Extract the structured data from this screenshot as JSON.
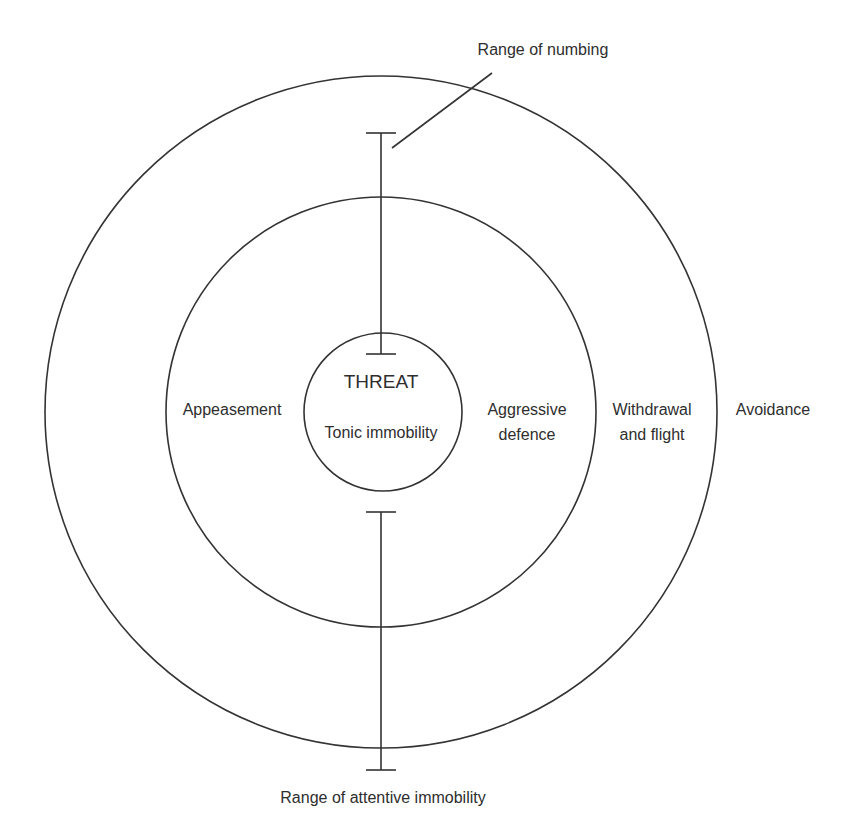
{
  "diagram": {
    "type": "concentric-circles",
    "colors": {
      "line": "#333333",
      "text": "#2e2e2e",
      "background": "#ffffff"
    },
    "center": {
      "title": "THREAT",
      "label": "Tonic immobility"
    },
    "rings": [
      {
        "name": "inner",
        "left_label": "",
        "right_label_lines": [
          "Aggressive",
          "defence"
        ]
      },
      {
        "name": "middle",
        "left_label": "Appeasement",
        "right_label_lines": [
          "Withdrawal",
          "and flight"
        ]
      },
      {
        "name": "outer",
        "left_label": "",
        "right_label_lines": [
          "Avoidance"
        ]
      }
    ],
    "inner_left_label": "Appeasement",
    "ranges": {
      "numbing": {
        "label": "Range of numbing"
      },
      "attentive_immobility": {
        "label": "Range of attentive immobility"
      }
    }
  }
}
